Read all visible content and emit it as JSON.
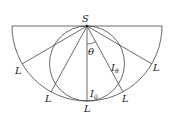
{
  "diagram": {
    "title": "",
    "source_label": "S",
    "angle_label": "θ",
    "intensity_theta": {
      "main": "I",
      "sub": "θ"
    },
    "intensity_zero": {
      "main": "I",
      "sub": "0"
    },
    "endpoint_labels": [
      "L",
      "L",
      "L",
      "L",
      "L"
    ],
    "stroke_color": "#444444",
    "background": "#ffffff"
  }
}
